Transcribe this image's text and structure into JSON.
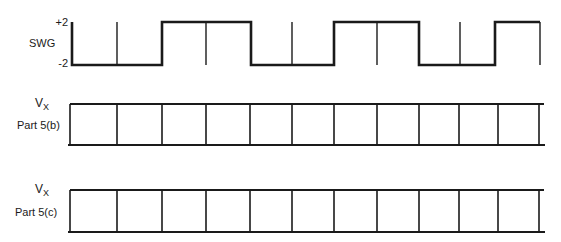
{
  "swg": {
    "label": "SWG",
    "high_label": "+2",
    "low_label": "-2",
    "high_value": 2,
    "low_value": -2,
    "transitions": [
      {
        "x": 72,
        "level": "low"
      },
      {
        "x": 162,
        "level": "high"
      },
      {
        "x": 251,
        "level": "low"
      },
      {
        "x": 334,
        "level": "high"
      },
      {
        "x": 419,
        "level": "low"
      },
      {
        "x": 495,
        "level": "high"
      }
    ],
    "tick_lines_x": [
      117,
      206,
      292,
      377,
      460,
      540
    ]
  },
  "grids": [
    {
      "v_label": "V",
      "v_sub": "X",
      "part_label": "Part 5(b)",
      "top": 104,
      "bottom": 145
    },
    {
      "v_label": "V",
      "v_sub": "X",
      "part_label": "Part 5(c)",
      "top": 190,
      "bottom": 232
    }
  ],
  "grid_columns_x": [
    70,
    117,
    162,
    206,
    250,
    292,
    334,
    377,
    419,
    459,
    498,
    539
  ],
  "colors": {
    "line": "#1a1a1a",
    "background": "#ffffff"
  }
}
